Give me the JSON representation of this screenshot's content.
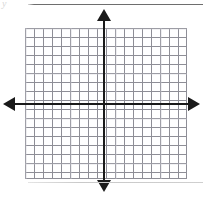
{
  "figure": {
    "width": 203,
    "height": 198,
    "background_color": "#ffffff"
  },
  "labels": {
    "y_axis_label": "y"
  },
  "rules": {
    "top_rule_color": "#6e6e6e",
    "bottom_rule_color": "#cfcfcf"
  },
  "chart_data": {
    "type": "scatter",
    "title": "",
    "subtitle": "",
    "xlabel": "",
    "ylabel": "y",
    "series": [],
    "x": [],
    "values": [],
    "annotations": [],
    "legend": [],
    "legend_position": "none",
    "grid": true,
    "grid_columns": 18,
    "grid_rows": 17,
    "grid_cell_px": 9,
    "xlim": [
      -9,
      9
    ],
    "ylim": [
      -9,
      8
    ],
    "x_ticks": [],
    "y_ticks": [],
    "x_tick_labels": [],
    "y_tick_labels": [],
    "axis_origin_px": [
      104,
      104
    ],
    "axis_color": "#1a1a1a",
    "grid_line_color": "#8e8e96",
    "arrowheads": [
      "left",
      "right",
      "up",
      "down"
    ]
  }
}
